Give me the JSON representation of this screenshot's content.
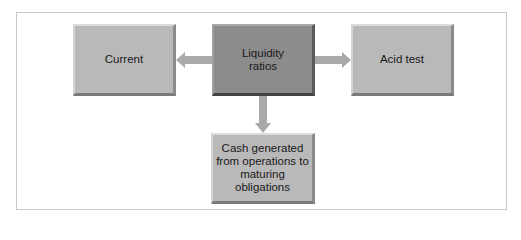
{
  "diagram": {
    "type": "hub-and-spoke",
    "center": {
      "label": "Liquidity ratios",
      "lines": [
        "Liquidity",
        "ratios"
      ]
    },
    "nodes": [
      {
        "id": "current",
        "label": "Current",
        "lines": [
          "Current"
        ],
        "direction": "left"
      },
      {
        "id": "acid-test",
        "label": "Acid test",
        "lines": [
          "Acid test"
        ],
        "direction": "right"
      },
      {
        "id": "cash",
        "label": "Cash generated from operations to maturing obligations",
        "lines": [
          "Cash generated",
          "from operations to",
          "maturing obligations"
        ],
        "direction": "down"
      }
    ],
    "edges": [
      {
        "from": "liquidity-ratios",
        "to": "current"
      },
      {
        "from": "liquidity-ratios",
        "to": "acid-test"
      },
      {
        "from": "liquidity-ratios",
        "to": "cash"
      }
    ],
    "colors": {
      "center_fill": "#8c8c8c",
      "node_fill": "#b9b9b9",
      "arrow_fill": "#a9a9a9",
      "frame_border": "#c8c8c8"
    }
  }
}
